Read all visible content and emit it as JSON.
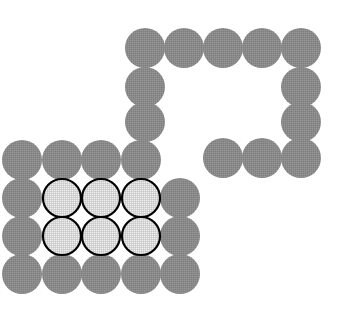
{
  "figure": {
    "canvas": {
      "width": 346,
      "height": 325,
      "background_color": "#ffffff"
    },
    "lattice": {
      "pitch_x": 39.2,
      "pitch_y": 38.6,
      "radius": 20,
      "origin_x": 22,
      "origin_y": 48
    },
    "palette": {
      "plain_fill": "#8a8a8a",
      "plain_texture": "#9a9a9a",
      "outlined_fill": "#d8d8d8",
      "outlined_texture": "#f0f0f0",
      "outline_stroke": "#000000",
      "background": "#ffffff"
    },
    "groups": [
      {
        "name": "upper-right-arch",
        "style": "plain",
        "description": "Inverted-U arch of gray discs forming the upper right open square",
        "count": 12
      },
      {
        "name": "lower-left-block",
        "style": "plain",
        "description": "Gray discs forming the border of the lower left rectangular block",
        "count": 15
      },
      {
        "name": "highlighted-core",
        "style": "outlined",
        "description": "Light stippled discs with black outlines forming a 3 by 2 inner core",
        "count": 6
      }
    ],
    "circles": [
      {
        "id": "c01",
        "cx": 145,
        "cy": 48,
        "r": 20,
        "style": "plain",
        "group": "upper-right-arch",
        "row": 0,
        "col": 3
      },
      {
        "id": "c02",
        "cx": 184,
        "cy": 48,
        "r": 20,
        "style": "plain",
        "group": "upper-right-arch",
        "row": 0,
        "col": 4
      },
      {
        "id": "c03",
        "cx": 223,
        "cy": 48,
        "r": 20,
        "style": "plain",
        "group": "upper-right-arch",
        "row": 0,
        "col": 5
      },
      {
        "id": "c04",
        "cx": 262,
        "cy": 48,
        "r": 20,
        "style": "plain",
        "group": "upper-right-arch",
        "row": 0,
        "col": 6
      },
      {
        "id": "c05",
        "cx": 301,
        "cy": 48,
        "r": 20,
        "style": "plain",
        "group": "upper-right-arch",
        "row": 0,
        "col": 7
      },
      {
        "id": "c06",
        "cx": 145,
        "cy": 87,
        "r": 20,
        "style": "plain",
        "group": "upper-right-arch",
        "row": 1,
        "col": 3
      },
      {
        "id": "c07",
        "cx": 301,
        "cy": 87,
        "r": 20,
        "style": "plain",
        "group": "upper-right-arch",
        "row": 1,
        "col": 7
      },
      {
        "id": "c08",
        "cx": 145,
        "cy": 122,
        "r": 20,
        "style": "plain",
        "group": "upper-right-arch",
        "row": 2,
        "col": 3
      },
      {
        "id": "c09",
        "cx": 301,
        "cy": 122,
        "r": 20,
        "style": "plain",
        "group": "upper-right-arch",
        "row": 2,
        "col": 7
      },
      {
        "id": "c10",
        "cx": 223,
        "cy": 158,
        "r": 20,
        "style": "plain",
        "group": "upper-right-arch",
        "row": 3,
        "col": 5
      },
      {
        "id": "c11",
        "cx": 262,
        "cy": 158,
        "r": 20,
        "style": "plain",
        "group": "upper-right-arch",
        "row": 3,
        "col": 6
      },
      {
        "id": "c12",
        "cx": 301,
        "cy": 158,
        "r": 20,
        "style": "plain",
        "group": "upper-right-arch",
        "row": 3,
        "col": 7
      },
      {
        "id": "c13",
        "cx": 22,
        "cy": 160,
        "r": 20,
        "style": "plain",
        "group": "lower-left-block",
        "row": 3,
        "col": 0
      },
      {
        "id": "c14",
        "cx": 62,
        "cy": 160,
        "r": 20,
        "style": "plain",
        "group": "lower-left-block",
        "row": 3,
        "col": 1
      },
      {
        "id": "c15",
        "cx": 101,
        "cy": 160,
        "r": 20,
        "style": "plain",
        "group": "lower-left-block",
        "row": 3,
        "col": 2
      },
      {
        "id": "c16",
        "cx": 141,
        "cy": 160,
        "r": 20,
        "style": "plain",
        "group": "lower-left-block",
        "row": 3,
        "col": 3
      },
      {
        "id": "c17",
        "cx": 22,
        "cy": 198,
        "r": 20,
        "style": "plain",
        "group": "lower-left-block",
        "row": 4,
        "col": 0
      },
      {
        "id": "c18",
        "cx": 62,
        "cy": 198,
        "r": 19,
        "style": "outlined",
        "group": "highlighted-core",
        "row": 4,
        "col": 1
      },
      {
        "id": "c19",
        "cx": 101,
        "cy": 198,
        "r": 19,
        "style": "outlined",
        "group": "highlighted-core",
        "row": 4,
        "col": 2
      },
      {
        "id": "c20",
        "cx": 141,
        "cy": 198,
        "r": 19,
        "style": "outlined",
        "group": "highlighted-core",
        "row": 4,
        "col": 3
      },
      {
        "id": "c21",
        "cx": 180,
        "cy": 198,
        "r": 20,
        "style": "plain",
        "group": "lower-left-block",
        "row": 4,
        "col": 4
      },
      {
        "id": "c22",
        "cx": 22,
        "cy": 236,
        "r": 20,
        "style": "plain",
        "group": "lower-left-block",
        "row": 5,
        "col": 0
      },
      {
        "id": "c23",
        "cx": 62,
        "cy": 236,
        "r": 19,
        "style": "outlined",
        "group": "highlighted-core",
        "row": 5,
        "col": 1
      },
      {
        "id": "c24",
        "cx": 101,
        "cy": 236,
        "r": 19,
        "style": "outlined",
        "group": "highlighted-core",
        "row": 5,
        "col": 2
      },
      {
        "id": "c25",
        "cx": 141,
        "cy": 236,
        "r": 19,
        "style": "outlined",
        "group": "highlighted-core",
        "row": 5,
        "col": 3
      },
      {
        "id": "c26",
        "cx": 180,
        "cy": 236,
        "r": 20,
        "style": "plain",
        "group": "lower-left-block",
        "row": 5,
        "col": 4
      },
      {
        "id": "c27",
        "cx": 22,
        "cy": 274,
        "r": 20,
        "style": "plain",
        "group": "lower-left-block",
        "row": 6,
        "col": 0
      },
      {
        "id": "c28",
        "cx": 62,
        "cy": 274,
        "r": 20,
        "style": "plain",
        "group": "lower-left-block",
        "row": 6,
        "col": 1
      },
      {
        "id": "c29",
        "cx": 101,
        "cy": 274,
        "r": 20,
        "style": "plain",
        "group": "lower-left-block",
        "row": 6,
        "col": 2
      },
      {
        "id": "c30",
        "cx": 141,
        "cy": 274,
        "r": 20,
        "style": "plain",
        "group": "lower-left-block",
        "row": 6,
        "col": 3
      },
      {
        "id": "c31",
        "cx": 180,
        "cy": 274,
        "r": 20,
        "style": "plain",
        "group": "lower-left-block",
        "row": 6,
        "col": 4
      }
    ],
    "counts": {
      "total": 31,
      "plain": 25,
      "outlined": 6
    }
  }
}
